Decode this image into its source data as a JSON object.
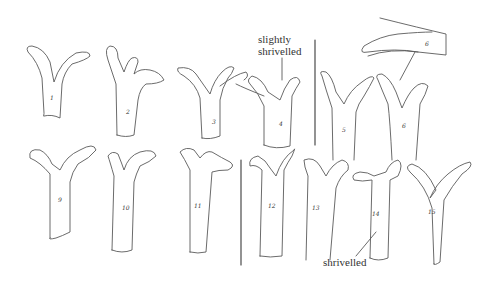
{
  "annotations": {
    "slightly_shrivelled": {
      "line1": "slightly",
      "line2": "shrivelled"
    },
    "shrivelled": "shrivelled"
  },
  "specimens": [
    {
      "label": "1"
    },
    {
      "label": "2"
    },
    {
      "label": "3"
    },
    {
      "label": "4"
    },
    {
      "label": "5"
    },
    {
      "label": "6"
    },
    {
      "label": "6"
    },
    {
      "label": "9"
    },
    {
      "label": "10"
    },
    {
      "label": "11"
    },
    {
      "label": "12"
    },
    {
      "label": "13"
    },
    {
      "label": "14"
    },
    {
      "label": "15"
    }
  ],
  "colors": {
    "ink": "#5a5a5a",
    "background": "#ffffff"
  }
}
